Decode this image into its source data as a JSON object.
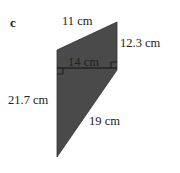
{
  "part_label": "c",
  "shape": {
    "type": "trapezium",
    "fill": "#4a4a4a",
    "vertices": [
      [
        57,
        50
      ],
      [
        117,
        22
      ],
      [
        117,
        70
      ],
      [
        57,
        157
      ]
    ]
  },
  "labels": {
    "top": "11 cm",
    "right": "12.3 cm",
    "height": "14 cm",
    "left": "21.7 cm",
    "slant": "19 cm"
  }
}
